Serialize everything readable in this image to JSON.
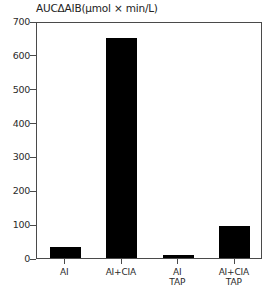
{
  "chart_data": {
    "type": "bar",
    "title": "AUCΔAIB(μmol × min/L)",
    "xlabel": "",
    "ylabel": "",
    "ylim": [
      0,
      700
    ],
    "yticks": [
      0,
      100,
      200,
      300,
      400,
      500,
      600,
      700
    ],
    "ytick_labels": [
      "0",
      "100",
      "200",
      "300",
      "400",
      "500",
      "600",
      "700"
    ],
    "grid": false,
    "legend": null,
    "bar_color": "#000000",
    "categories": [
      "AI",
      "AI+CIA",
      "AI\nTAP",
      "AI+CIA\nTAP"
    ],
    "values": [
      32,
      650,
      9,
      94
    ]
  },
  "axes": {
    "frame_color": "#4a4a4a"
  }
}
